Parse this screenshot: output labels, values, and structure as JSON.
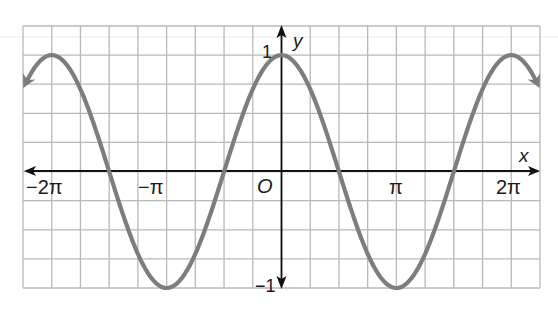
{
  "chart_data": {
    "type": "line",
    "title": "",
    "function": "y = cos x",
    "xlabel": "x",
    "ylabel": "y",
    "origin_label": "O",
    "x_ticks": [
      {
        "value": -6.2832,
        "label": "−2π"
      },
      {
        "value": -3.1416,
        "label": "−π"
      },
      {
        "value": 3.1416,
        "label": "π"
      },
      {
        "value": 6.2832,
        "label": "2π"
      }
    ],
    "y_ticks": [
      {
        "value": 1,
        "label": "1"
      },
      {
        "value": -1,
        "label": "−1"
      }
    ],
    "xlim": [
      -7.07,
      7.07
    ],
    "ylim": [
      -1,
      1.25
    ],
    "grid": true,
    "grid_step_x": "π/4",
    "grid_step_y": 0.25,
    "series": [
      {
        "name": "cos x",
        "color": "#7d7d7d",
        "arrows_both_ends": true,
        "x": [
          -7.07,
          -6.2832,
          -5.4978,
          -4.7124,
          -3.927,
          -3.1416,
          -2.3562,
          -1.5708,
          -0.7854,
          0,
          0.7854,
          1.5708,
          2.3562,
          3.1416,
          3.927,
          4.7124,
          5.4978,
          6.2832,
          7.07
        ],
        "y": [
          0.707,
          1,
          0.707,
          0,
          -0.707,
          -1,
          -0.707,
          0,
          0.707,
          1,
          0.707,
          0,
          -0.707,
          -1,
          -0.707,
          0,
          0.707,
          1,
          0.707
        ]
      }
    ],
    "colors": {
      "curve": "#7d7d7d",
      "grid": "#b8b8b8",
      "axis": "#111111"
    }
  },
  "labels": {
    "x_axis": "x",
    "y_axis": "y",
    "origin": "O",
    "y_max": "1",
    "y_min": "−1",
    "x_neg_2pi": "−2π",
    "x_neg_pi": "−π",
    "x_pi": "π",
    "x_2pi": "2π"
  }
}
